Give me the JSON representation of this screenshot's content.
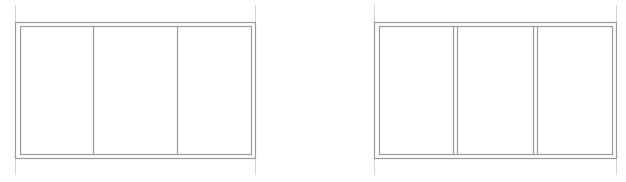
{
  "diagram": {
    "type": "window-elevations",
    "line_color": "#9a9a9a",
    "extension_line_color": "#d4d4d4",
    "background": "#ffffff",
    "elevations": [
      {
        "id": "left",
        "outer": {
          "x": 15,
          "y": 22,
          "w": 240,
          "h": 136
        },
        "inner": {
          "x": 20,
          "y": 26,
          "w": 231,
          "h": 128
        },
        "panes": 3,
        "mullion_style": "single",
        "mullions_x": [
          93,
          177
        ],
        "extension_lines_x": [
          15,
          255
        ],
        "extension_y": [
          5,
          175
        ]
      },
      {
        "id": "right",
        "outer": {
          "x": 374,
          "y": 22,
          "w": 242,
          "h": 136
        },
        "inner": {
          "x": 379,
          "y": 26,
          "w": 233,
          "h": 128
        },
        "panes": 3,
        "mullion_style": "double",
        "mullions_x": [
          [
            453,
            457
          ],
          [
            533,
            537
          ]
        ],
        "extension_lines_x": [
          374,
          616
        ],
        "extension_y": [
          5,
          175
        ]
      }
    ]
  }
}
